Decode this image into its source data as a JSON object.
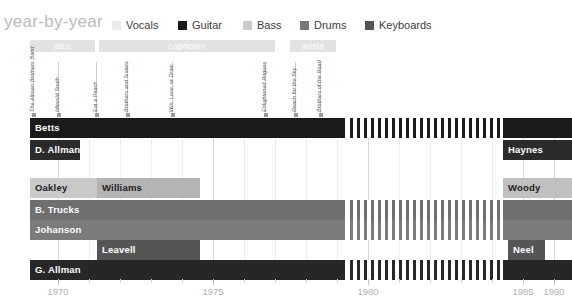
{
  "header": {
    "title": "year-by-year",
    "legend": [
      {
        "name": "Vocals",
        "color": "#ebebeb",
        "x": 112
      },
      {
        "name": "Guitar",
        "color": "#1a1a1a",
        "x": 178
      },
      {
        "name": "Bass",
        "color": "#c9c9c9",
        "x": 243
      },
      {
        "name": "Drums",
        "color": "#777777",
        "x": 300
      },
      {
        "name": "Keyboards",
        "color": "#555555",
        "x": 365
      }
    ]
  },
  "record_labels": [
    {
      "name": "atco",
      "x": 30,
      "w": 65,
      "color": "#e2e2e2"
    },
    {
      "name": "capricorn",
      "x": 99,
      "w": 176,
      "color": "#e2e2e2"
    },
    {
      "name": "arista",
      "x": 290,
      "w": 46,
      "color": "#e2e2e2"
    }
  ],
  "albums": [
    {
      "name": "The Allman Brothers Band",
      "x": 33
    },
    {
      "name": "Idlewild South",
      "x": 58
    },
    {
      "name": "Eat a Peach",
      "x": 96
    },
    {
      "name": "Brothers and Sisters",
      "x": 127
    },
    {
      "name": "Win, Lose, or Draw",
      "x": 172
    },
    {
      "name": "Enlightened Rogues",
      "x": 265
    },
    {
      "name": "Reach for the Sky",
      "x": 295
    },
    {
      "name": "Brothers of the Road",
      "x": 320
    }
  ],
  "axis": {
    "ticks": [
      {
        "label": "1970",
        "x": 58,
        "major": true
      },
      {
        "label": "",
        "x": 89,
        "major": false
      },
      {
        "label": "",
        "x": 120,
        "major": false
      },
      {
        "label": "",
        "x": 151,
        "major": false
      },
      {
        "label": "",
        "x": 182,
        "major": false
      },
      {
        "label": "1975",
        "x": 213,
        "major": true
      },
      {
        "label": "",
        "x": 244,
        "major": false
      },
      {
        "label": "",
        "x": 275,
        "major": false
      },
      {
        "label": "",
        "x": 306,
        "major": false
      },
      {
        "label": "",
        "x": 337,
        "major": false
      },
      {
        "label": "1980",
        "x": 368,
        "major": true
      },
      {
        "label": "",
        "x": 399,
        "major": false
      },
      {
        "label": "",
        "x": 430,
        "major": false
      },
      {
        "label": "",
        "x": 461,
        "major": false
      },
      {
        "label": "",
        "x": 492,
        "major": false
      },
      {
        "label": "1985",
        "x": 523,
        "major": true
      },
      {
        "label": "",
        "x": 554,
        "major": false
      },
      {
        "label": "1990",
        "x": 554,
        "major": true
      }
    ]
  },
  "chart_data": {
    "type": "bar",
    "title": "year-by-year",
    "xlabel": "",
    "ylabel": "",
    "xlim": [
      1969,
      1991
    ],
    "grid": true,
    "legend_position": "top",
    "categories": [
      "Betts",
      "D. Allman",
      "Oakley / Williams",
      "B. Trucks",
      "Johanson",
      "Leavell",
      "G. Allman"
    ],
    "series": [
      {
        "name": "Guitar",
        "color": "#1a1a1a"
      },
      {
        "name": "Bass",
        "color": "#c9c9c9"
      },
      {
        "name": "Drums",
        "color": "#777777"
      },
      {
        "name": "Keyboards",
        "color": "#555555"
      },
      {
        "name": "Vocals",
        "color": "#2b2b2b"
      }
    ],
    "rows": [
      {
        "row": 0,
        "y": 0,
        "role": "Guitar",
        "bars": [
          {
            "name": "Betts",
            "x": 30,
            "w": 315,
            "color": "#1a1a1a",
            "light": false,
            "label": true
          },
          {
            "name": "Betts",
            "x": 350,
            "w": 150,
            "color": "#1a1a1a",
            "light": false,
            "label": false,
            "hatch": true
          },
          {
            "name": "Betts",
            "x": 503,
            "w": 69,
            "color": "#1a1a1a",
            "light": false,
            "label": false
          }
        ]
      },
      {
        "row": 1,
        "y": 22,
        "role": "Guitar",
        "bars": [
          {
            "name": "D. Allman",
            "x": 30,
            "w": 50,
            "color": "#2b2b2b",
            "light": false,
            "label": true
          },
          {
            "name": "Haynes",
            "x": 503,
            "w": 69,
            "color": "#2b2b2b",
            "light": false,
            "label": true
          }
        ]
      },
      {
        "row": 2,
        "y": 60,
        "role": "Bass",
        "bars": [
          {
            "name": "Oakley",
            "x": 30,
            "w": 67,
            "color": "#c9c9c9",
            "light": true,
            "label": true
          },
          {
            "name": "Williams",
            "x": 97,
            "w": 103,
            "color": "#b4b4b4",
            "light": true,
            "label": true
          },
          {
            "name": "Woody",
            "x": 503,
            "w": 69,
            "color": "#c0c0c0",
            "light": true,
            "label": true
          }
        ]
      },
      {
        "row": 3,
        "y": 82,
        "role": "Drums",
        "bars": [
          {
            "name": "B. Trucks",
            "x": 30,
            "w": 315,
            "color": "#6f6f6f",
            "light": false,
            "label": true
          },
          {
            "name": "B. Trucks",
            "x": 350,
            "w": 150,
            "color": "#6f6f6f",
            "light": false,
            "label": false,
            "hatch": true
          },
          {
            "name": "B. Trucks",
            "x": 503,
            "w": 69,
            "color": "#6f6f6f",
            "light": false,
            "label": false
          }
        ]
      },
      {
        "row": 4,
        "y": 102,
        "role": "Drums",
        "bars": [
          {
            "name": "Johanson",
            "x": 30,
            "w": 315,
            "color": "#7b7b7b",
            "light": false,
            "label": true
          },
          {
            "name": "Johanson",
            "x": 350,
            "w": 150,
            "color": "#7b7b7b",
            "light": false,
            "label": false,
            "hatch": true
          },
          {
            "name": "Johanson",
            "x": 503,
            "w": 69,
            "color": "#7b7b7b",
            "light": false,
            "label": false
          }
        ]
      },
      {
        "row": 5,
        "y": 122,
        "role": "Keyboards",
        "bars": [
          {
            "name": "Leavell",
            "x": 97,
            "w": 103,
            "color": "#555555",
            "light": false,
            "label": true
          },
          {
            "name": "Neel",
            "x": 508,
            "w": 37,
            "color": "#555555",
            "light": false,
            "label": true
          }
        ]
      },
      {
        "row": 6,
        "y": 142,
        "role": "Vocals",
        "bars": [
          {
            "name": "G. Allman",
            "x": 30,
            "w": 315,
            "color": "#272727",
            "light": false,
            "label": true
          },
          {
            "name": "G. Allman",
            "x": 350,
            "w": 150,
            "color": "#272727",
            "light": false,
            "label": false,
            "hatch": true
          },
          {
            "name": "G. Allman",
            "x": 503,
            "w": 69,
            "color": "#272727",
            "light": false,
            "label": false
          }
        ]
      }
    ]
  }
}
